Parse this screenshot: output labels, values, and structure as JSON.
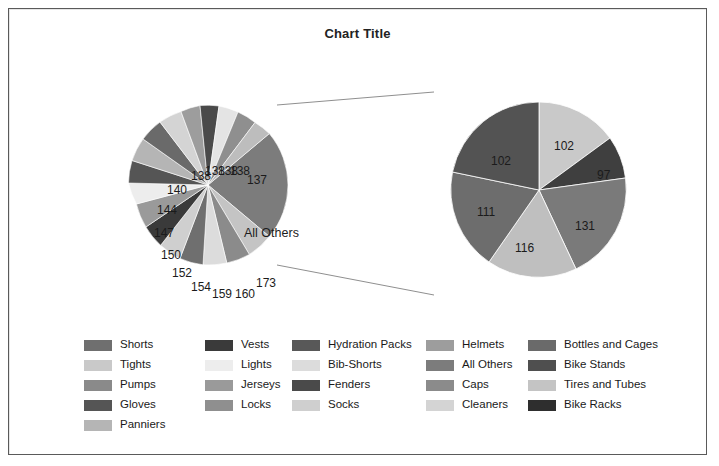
{
  "chart_data": {
    "type": "pie",
    "variant": "pie-of-pie",
    "title": "Chart Title",
    "legend_position": "bottom",
    "grid": false,
    "primary_pie": {
      "name": "Main pie",
      "labels": [
        "All Others",
        "173",
        "160",
        "159",
        "154",
        "152",
        "150",
        "147",
        "144",
        "140",
        "138",
        "138",
        "138",
        "138",
        "137"
      ],
      "values": [
        659,
        173,
        160,
        159,
        154,
        152,
        150,
        147,
        144,
        140,
        138,
        138,
        138,
        138,
        137
      ],
      "aggregate_slice_label": "All Others"
    },
    "secondary_pie": {
      "name": "All Others breakdown",
      "labels": [
        "102",
        "97",
        "131",
        "116",
        "111",
        "102"
      ],
      "values": [
        102,
        97,
        131,
        116,
        111,
        102
      ]
    },
    "categories": [
      "Shorts",
      "Tights",
      "Pumps",
      "Gloves",
      "Panniers",
      "Vests",
      "Lights",
      "Jerseys",
      "Locks",
      "Hydration Packs",
      "Bib-Shorts",
      "Fenders",
      "Socks",
      "Helmets",
      "All Others",
      "Caps",
      "Cleaners",
      "Bottles and Cages",
      "Bike Stands",
      "Tires and Tubes",
      "Bike Racks"
    ]
  },
  "frame": {
    "border_color": "#5a5a5a",
    "background": "#ffffff"
  },
  "title": {
    "text": "Chart Title"
  },
  "primary_labels": {
    "l0": "138",
    "l1": "138",
    "l2": "138",
    "l3": "138",
    "l4": "137",
    "l5": "140",
    "l6": "144",
    "l7": "147",
    "l8": "150",
    "l9": "152",
    "l10": "154",
    "l11": "159",
    "l12": "160",
    "l13": "173",
    "all_others": "All Others"
  },
  "secondary_labels": {
    "s0": "102",
    "s1": "97",
    "s2": "131",
    "s3": "116",
    "s4": "111",
    "s5": "102"
  },
  "legend": {
    "columns": [
      {
        "items": [
          {
            "label": "Shorts",
            "color": "#6f6f6f"
          },
          {
            "label": "Tights",
            "color": "#c9c9c9"
          },
          {
            "label": "Pumps",
            "color": "#8a8a8a"
          },
          {
            "label": "Gloves",
            "color": "#555555"
          },
          {
            "label": "Panniers",
            "color": "#b5b5b5"
          }
        ]
      },
      {
        "items": [
          {
            "label": "Vests",
            "color": "#3a3a3a"
          },
          {
            "label": "Lights",
            "color": "#ededed"
          },
          {
            "label": "Jerseys",
            "color": "#9a9a9a"
          },
          {
            "label": "Locks",
            "color": "#8f8f8f"
          }
        ]
      },
      {
        "items": [
          {
            "label": "Hydration Packs",
            "color": "#585858"
          },
          {
            "label": "Bib-Shorts",
            "color": "#dcdcdc"
          },
          {
            "label": "Fenders",
            "color": "#4a4a4a"
          },
          {
            "label": "Socks",
            "color": "#cfcfcf"
          }
        ]
      },
      {
        "items": [
          {
            "label": "Helmets",
            "color": "#9d9d9d"
          },
          {
            "label": "All Others",
            "color": "#7c7c7c"
          },
          {
            "label": "Caps",
            "color": "#8b8b8b"
          },
          {
            "label": "Cleaners",
            "color": "#d4d4d4"
          }
        ]
      },
      {
        "items": [
          {
            "label": "Bottles and Cages",
            "color": "#6a6a6a"
          },
          {
            "label": "Bike Stands",
            "color": "#4f4f4f"
          },
          {
            "label": "Tires and Tubes",
            "color": "#c4c4c4"
          },
          {
            "label": "Bike Racks",
            "color": "#2e2e2e"
          }
        ]
      }
    ]
  }
}
